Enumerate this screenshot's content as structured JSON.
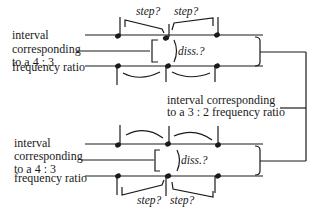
{
  "diagram": {
    "top_system": {
      "label_lines": [
        "interval",
        "corresponding",
        "to a 4 : 3",
        "frequency ratio"
      ],
      "step_labels": [
        "step?",
        "step?"
      ],
      "diss_label": "diss.?"
    },
    "middle_label": {
      "lines": [
        "interval  corresponding",
        "to a 3 : 2  frequency ratio"
      ]
    },
    "bottom_system": {
      "label_lines": [
        "interval",
        "corresponding",
        "to a 4 : 3",
        "frequency ratio"
      ],
      "step_labels": [
        "step?",
        "step?"
      ],
      "diss_label": "diss.?"
    }
  }
}
